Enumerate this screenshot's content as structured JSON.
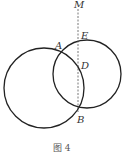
{
  "diagram": {
    "caption": "图 4",
    "points": {
      "M": "M",
      "E": "E",
      "A": "A",
      "D": "D",
      "B": "B"
    },
    "circles": [
      {
        "name": "left-circle",
        "cx": 44,
        "cy": 88,
        "r": 40
      },
      {
        "name": "right-circle",
        "cx": 87,
        "cy": 74,
        "r": 34
      }
    ],
    "dashed_line": {
      "x": 78,
      "y1": 8,
      "y2": 113
    },
    "stroke_color": "#222222"
  }
}
